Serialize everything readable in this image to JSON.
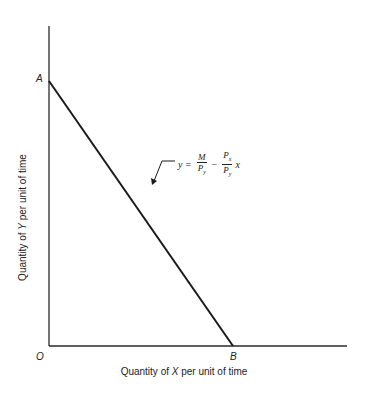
{
  "diagram": {
    "type": "budget-line",
    "points": {
      "origin": "O",
      "y_intercept": "A",
      "x_intercept": "B"
    },
    "axes": {
      "x_label_prefix": "Quantity of ",
      "x_label_var": "X",
      "x_label_suffix": " per unit of time",
      "y_label_prefix": "Quantity of ",
      "y_label_var": "Y",
      "y_label_suffix": " per unit of time"
    },
    "equation": {
      "lhs": "y",
      "eq": "=",
      "term1_num": "M",
      "term1_den": "P",
      "term1_den_sub": "y",
      "minus": "−",
      "term2_num": "P",
      "term2_num_sub": "x",
      "term2_den": "P",
      "term2_den_sub": "y",
      "var": "x"
    },
    "colors": {
      "line": "#1a1a1a",
      "axis": "#2a2a2a",
      "background": "#ffffff"
    }
  }
}
